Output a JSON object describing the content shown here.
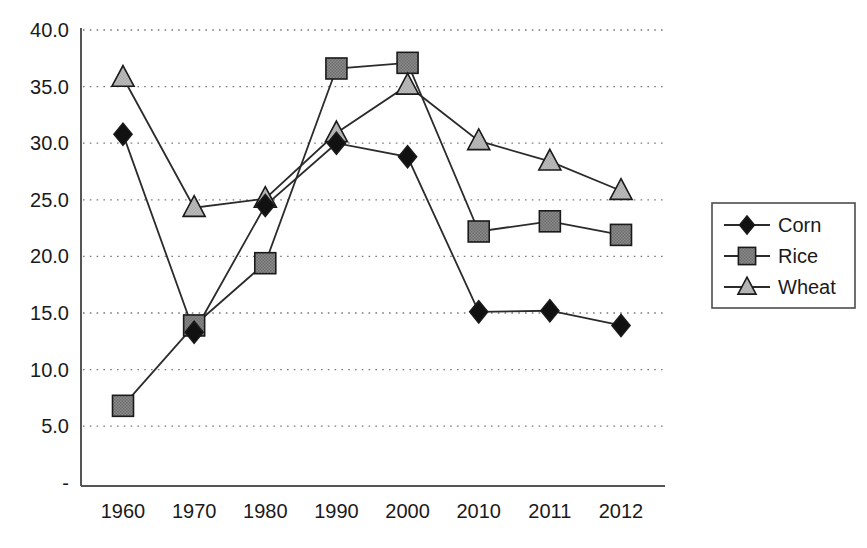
{
  "chart_data": {
    "type": "line",
    "title": "",
    "subtitle": "",
    "xlabel": "",
    "ylabel": "",
    "categories": [
      "1960",
      "1970",
      "1980",
      "1990",
      "2000",
      "2010",
      "2011",
      "2012"
    ],
    "x_tick_labels": [
      "1960",
      "1970",
      "1980",
      "1990",
      "2000",
      "2010",
      "2011",
      "2012"
    ],
    "y_tick_labels": [
      "40.0",
      "35.0",
      "30.0",
      "25.0",
      "20.0",
      "15.0",
      "10.0",
      "5.0",
      "-"
    ],
    "y_tick_values": [
      40.0,
      35.0,
      30.0,
      25.0,
      20.0,
      15.0,
      10.0,
      5.0,
      0.0
    ],
    "ylim": [
      0,
      40
    ],
    "grid": true,
    "grid_axis": "y",
    "legend_position": "right",
    "series": [
      {
        "name": "Corn",
        "marker": "diamond",
        "color": "#111111",
        "values": [
          30.8,
          13.3,
          24.5,
          30.0,
          28.8,
          15.1,
          15.2,
          13.9
        ]
      },
      {
        "name": "Rice",
        "marker": "square",
        "color": "#808080",
        "values": [
          6.8,
          13.9,
          19.4,
          36.6,
          37.1,
          22.2,
          23.1,
          21.9
        ]
      },
      {
        "name": "Wheat",
        "marker": "triangle",
        "color": "#b3b3b3",
        "values": [
          35.8,
          24.3,
          25.1,
          30.9,
          35.1,
          30.2,
          28.4,
          25.8
        ]
      }
    ]
  },
  "legend": {
    "entries": [
      {
        "label": "Corn"
      },
      {
        "label": "Rice"
      },
      {
        "label": "Wheat"
      }
    ]
  },
  "colors": {
    "corn": "#111111",
    "rice": "#808080",
    "wheat": "#b3b3b3",
    "axis": "#555555",
    "grid": "#7a7a7a",
    "line": "#2b2b2b",
    "text": "#1a1a1a",
    "background": "#ffffff"
  }
}
